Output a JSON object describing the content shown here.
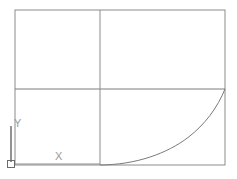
{
  "app": {
    "kind": "cad-line-drawing",
    "background_color": "#ffffff"
  },
  "colors": {
    "geometry_line": "#8c8c8c",
    "geometry_line_dark": "#6b6b6b",
    "curve_line": "#7a7a7a",
    "ucs_icon": "#5a5a5a",
    "axis_label": "#9a9a9a"
  },
  "ucs_icon": {
    "x_label": "X",
    "y_label": "Y",
    "origin_marker": "square",
    "x_label_glyph": "✕",
    "y_label_glyph": "Y"
  },
  "geometry": {
    "outer_rectangle": {
      "name": "outer-rectangle",
      "x": 15,
      "y": 10,
      "width": 210,
      "height": 155
    },
    "horizontal_divider": {
      "name": "horizontal-divider",
      "x1": 15,
      "y1": 89,
      "x2": 225,
      "y2": 89
    },
    "vertical_divider": {
      "name": "vertical-divider",
      "x1": 100,
      "y1": 10,
      "x2": 100,
      "y2": 165
    },
    "curve": {
      "name": "exponential-curve",
      "type": "exponential",
      "start": [
        100,
        165
      ],
      "end": [
        225,
        89
      ],
      "path": "M 100 165 C 135 164.5 168 153 189 137 C 205 124.5 217 107 225 89"
    },
    "ucs_y_axis": {
      "name": "ucs-y-axis",
      "x1": 11,
      "y1": 126,
      "x2": 11,
      "y2": 163
    },
    "ucs_x_axis": {
      "name": "ucs-x-axis",
      "x1": 14,
      "y1": 164,
      "x2": 100,
      "y2": 164
    },
    "ucs_origin_square": {
      "name": "ucs-origin-square",
      "x": 7,
      "y": 160,
      "size": 7
    }
  },
  "labels": {
    "x": {
      "text": "X",
      "x": 62,
      "y": 160
    },
    "y": {
      "text": "Y",
      "x": 17,
      "y": 127
    }
  }
}
